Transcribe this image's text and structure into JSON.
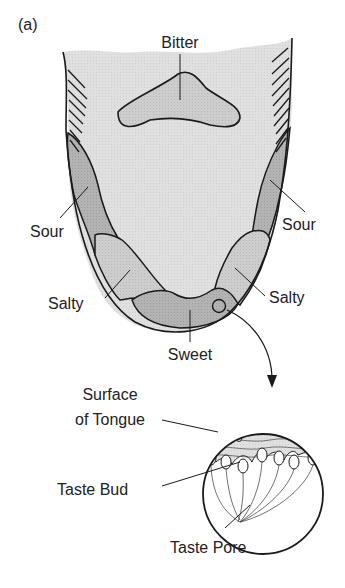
{
  "figure": {
    "panel_label": "(a)",
    "colors": {
      "background": "#ffffff",
      "tongue_fill": "#e2e2e2",
      "zone_fill": "#b4b4b4",
      "salty_fill": "#cfcfcf",
      "outline": "#1a1a1a",
      "label": "#222222"
    }
  },
  "tongue": {
    "labels": {
      "bitter": "Bitter",
      "sour_left": "Sour",
      "sour_right": "Sour",
      "salty_left": "Salty",
      "salty_right": "Salty",
      "sweet": "Sweet"
    }
  },
  "inset": {
    "labels": {
      "surface": "Surface",
      "surface2": "of Tongue",
      "taste_bud": "Taste Bud",
      "taste_pore": "Taste Pore"
    }
  }
}
